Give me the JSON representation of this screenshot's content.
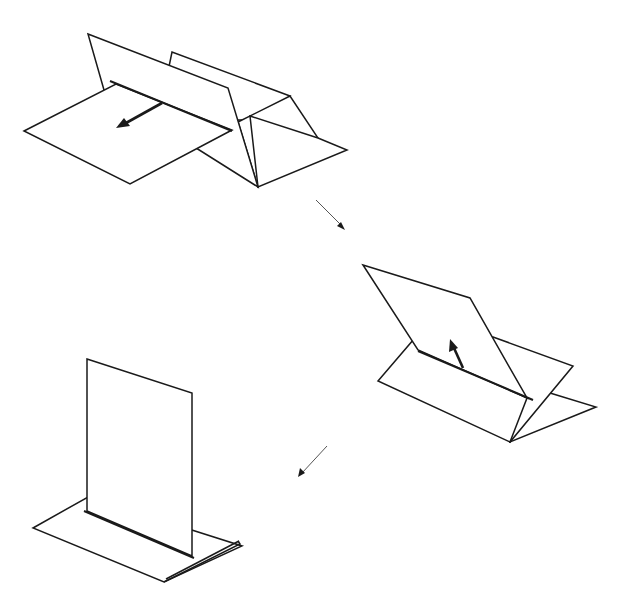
{
  "diagram": {
    "type": "folding-sequence",
    "stroke_color": "#1a1a1a",
    "background": "#ffffff",
    "steps": [
      {
        "id": 1,
        "name": "tent-with-flap-laid-forward",
        "motion": "arrow pointing down-left along flap"
      },
      {
        "id": 2,
        "name": "flap-raised-diagonally",
        "motion": "arrow pointing up along flap"
      },
      {
        "id": 3,
        "name": "flap-standing-vertical",
        "motion": "none"
      }
    ],
    "transitions": [
      {
        "from": 1,
        "to": 2,
        "direction": "down-right"
      },
      {
        "from": 2,
        "to": 3,
        "direction": "down-left"
      }
    ]
  }
}
